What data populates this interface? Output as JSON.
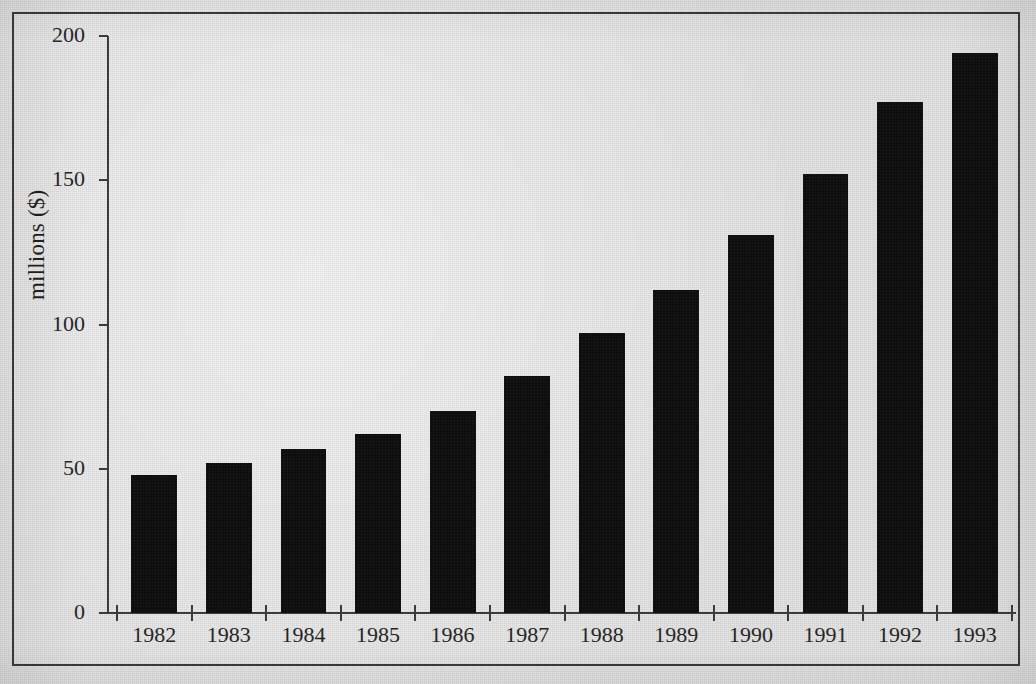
{
  "chart_data": {
    "type": "bar",
    "title": "",
    "subtitle": "",
    "xlabel": "",
    "ylabel": "millions ($)",
    "categories": [
      "1982",
      "1983",
      "1984",
      "1985",
      "1986",
      "1987",
      "1988",
      "1989",
      "1990",
      "1991",
      "1992",
      "1993"
    ],
    "values": [
      48,
      52,
      57,
      62,
      70,
      82,
      97,
      112,
      131,
      152,
      177,
      194
    ],
    "series": [
      {
        "name": "millions ($)",
        "values": [
          48,
          52,
          57,
          62,
          70,
          82,
          97,
          112,
          131,
          152,
          177,
          194
        ]
      }
    ],
    "ylim": [
      0,
      200
    ],
    "ytick_labels": [
      "0",
      "50",
      "100",
      "150",
      "200"
    ],
    "ytick_values": [
      0,
      50,
      100,
      150,
      200
    ],
    "grid": false,
    "legend": false,
    "legend_position": "none",
    "bar_color": "#0d0d0d",
    "background_color": "#e2e2e2",
    "axis_color": "#3c3c3c",
    "text_color": "#262626",
    "annotations": []
  },
  "figure": {
    "frame_border_color": "#3a3a3a",
    "y_axis_title": "millions ($)"
  }
}
